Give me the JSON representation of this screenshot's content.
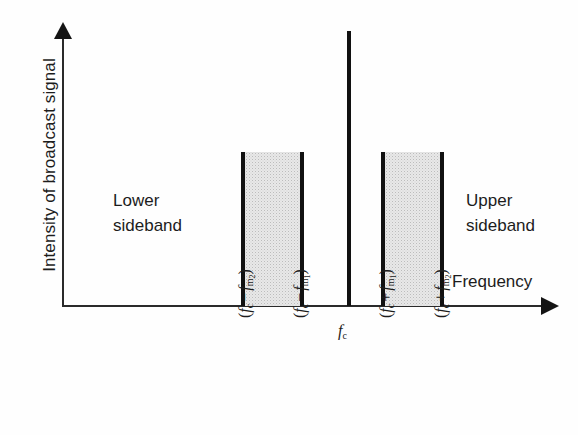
{
  "figure": {
    "axes": {
      "y_label": "Intensity of broadcast signal",
      "x_label": "Frequency"
    },
    "annotations": {
      "lower_sideband_line1": "Lower",
      "lower_sideband_line2": "sideband",
      "upper_sideband_line1": "Upper",
      "upper_sideband_line2": "sideband"
    },
    "colors": {
      "ink": "#1a1a1a",
      "band_fill": "#e8e8e8",
      "band_edge": "#111111",
      "background": "#ffffff"
    }
  },
  "chart_data": {
    "type": "bar",
    "xlabel": "Frequency",
    "ylabel": "Intensity of broadcast signal",
    "grid": false,
    "legend": "none",
    "axis_style": "arrow-terminated, no numeric scale",
    "categories": [
      "(fc − fm2)",
      "(fc − fm1)",
      "fc",
      "(fc + fm1)",
      "(fc + fm2)"
    ],
    "tick_labels": [
      {
        "id": "lower-outer",
        "text": "(f_c − f_m2)",
        "orientation": "vertical",
        "x_px": 242
      },
      {
        "id": "lower-inner",
        "text": "(f_c − f_m1)",
        "orientation": "vertical",
        "x_px": 300
      },
      {
        "id": "carrier",
        "text": "f_c",
        "orientation": "horizontal",
        "x_px": 349
      },
      {
        "id": "upper-inner",
        "text": "(f_c + f_m1)",
        "orientation": "vertical",
        "x_px": 383
      },
      {
        "id": "upper-outer",
        "text": "(f_c + f_m2)",
        "orientation": "vertical",
        "x_px": 441
      }
    ],
    "elements": [
      {
        "name": "lower-sideband-band",
        "kind": "filled-band",
        "x_start_label": "(fc − fm2)",
        "x_end_label": "(fc − fm1)",
        "relative_height": 0.56,
        "fill": "stippled-gray",
        "edges": "thick-black-vertical"
      },
      {
        "name": "carrier-spike",
        "kind": "impulse",
        "x_label": "fc",
        "relative_height": 1.0,
        "fill": "solid-black"
      },
      {
        "name": "upper-sideband-band",
        "kind": "filled-band",
        "x_start_label": "(fc + fm1)",
        "x_end_label": "(fc + fm2)",
        "relative_height": 0.56,
        "fill": "stippled-gray",
        "edges": "thick-black-vertical"
      }
    ],
    "values": [
      0.56,
      0.56,
      1.0,
      0.56,
      0.56
    ],
    "ylim": [
      0,
      1.0
    ],
    "annotations": [
      {
        "text": "Lower sideband",
        "x_px": 140,
        "y_px": 210
      },
      {
        "text": "Upper sideband",
        "x_px": 500,
        "y_px": 210
      }
    ]
  }
}
